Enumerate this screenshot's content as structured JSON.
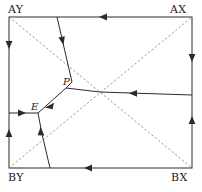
{
  "figure": {
    "type": "geometric-diagram",
    "width": 202,
    "height": 192,
    "colors": {
      "stroke": "#2b2b2b",
      "dashed_stroke": "#8a8a8a",
      "background": "#ffffff",
      "text": "#1a1a1a"
    },
    "corner_labels": [
      {
        "id": "AY",
        "text": "AY",
        "x": 9,
        "y": 17
      },
      {
        "id": "AX",
        "text": "AX",
        "x": 192,
        "y": 17
      },
      {
        "id": "BY",
        "text": "BY",
        "x": 9,
        "y": 168
      },
      {
        "id": "BX",
        "text": "BX",
        "x": 192,
        "y": 168
      }
    ],
    "node_labels": [
      {
        "id": "P",
        "text": "P",
        "x": 70,
        "y": 86
      },
      {
        "id": "E",
        "text": "E",
        "x": 39,
        "y": 110
      }
    ],
    "boundary": {
      "name": "outer-rectangle",
      "x1": 9,
      "y1": 17,
      "x2": 192,
      "y2": 168,
      "style": "solid"
    },
    "diagonals": [
      {
        "name": "diagonal-AY-BX",
        "x1": 9,
        "y1": 17,
        "x2": 192,
        "y2": 168,
        "style": "dashed"
      },
      {
        "name": "diagonal-BY-AX",
        "x1": 9,
        "y1": 168,
        "x2": 192,
        "y2": 17,
        "style": "dashed"
      }
    ],
    "network_edges": [
      {
        "name": "edge-top-to-bend",
        "x1": 57,
        "y1": 17,
        "x2": 72,
        "y2": 82,
        "style": "solid"
      },
      {
        "name": "edge-bend-to-P",
        "x1": 72,
        "y1": 82,
        "x2": 66,
        "y2": 88,
        "style": "solid"
      },
      {
        "name": "edge-P-to-center",
        "x1": 66,
        "y1": 88,
        "x2": 100,
        "y2": 92,
        "style": "solid"
      },
      {
        "name": "edge-center-right",
        "x1": 100,
        "y1": 92,
        "x2": 192,
        "y2": 95,
        "style": "solid"
      },
      {
        "name": "edge-P-to-E",
        "x1": 66,
        "y1": 88,
        "x2": 38,
        "y2": 113,
        "style": "solid"
      },
      {
        "name": "edge-E-to-left",
        "x1": 38,
        "y1": 113,
        "x2": 9,
        "y2": 113,
        "style": "solid"
      },
      {
        "name": "edge-E-to-lower",
        "x1": 38,
        "y1": 113,
        "x2": 42,
        "y2": 134,
        "style": "solid"
      },
      {
        "name": "edge-lower-bottom",
        "x1": 42,
        "y1": 134,
        "x2": 50,
        "y2": 168,
        "style": "solid"
      }
    ],
    "arrows": [
      {
        "name": "arrow-top-edge",
        "x": 103,
        "y": 17,
        "dir": "left"
      },
      {
        "name": "arrow-bottom-edge",
        "x": 88,
        "y": 168,
        "dir": "left"
      },
      {
        "name": "arrow-left-edge-upper",
        "x": 9,
        "y": 45,
        "dir": "down"
      },
      {
        "name": "arrow-left-edge-lower",
        "x": 9,
        "y": 133,
        "dir": "up"
      },
      {
        "name": "arrow-right-edge-up",
        "x": 192,
        "y": 58,
        "dir": "down"
      },
      {
        "name": "arrow-right-edge-low",
        "x": 192,
        "y": 120,
        "dir": "up"
      },
      {
        "name": "arrow-branch-top",
        "x": 62,
        "y": 41,
        "dir": "down"
      },
      {
        "name": "arrow-branch-right",
        "x": 133,
        "y": 93,
        "dir": "left"
      },
      {
        "name": "arrow-branch-PE",
        "x": 49,
        "y": 104,
        "dir": "down-left"
      },
      {
        "name": "arrow-branch-left",
        "x": 22,
        "y": 113,
        "dir": "right"
      },
      {
        "name": "arrow-branch-lower",
        "x": 41,
        "y": 131,
        "dir": "up"
      }
    ]
  }
}
